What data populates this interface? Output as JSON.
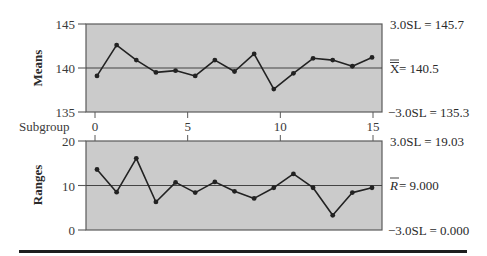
{
  "chart_data": [
    {
      "type": "line",
      "title": "X-bar chart",
      "ylabel": "Means",
      "xlabel": "Subgroup",
      "x": [
        1,
        2,
        3,
        4,
        5,
        6,
        7,
        8,
        9,
        10,
        11,
        12,
        13,
        14,
        15
      ],
      "series": [
        {
          "name": "Means",
          "values": [
            139.1,
            142.6,
            140.9,
            139.5,
            139.7,
            139.1,
            140.9,
            139.6,
            141.6,
            137.6,
            139.4,
            141.1,
            140.9,
            140.2,
            141.2
          ]
        }
      ],
      "ylim": [
        135,
        145
      ],
      "yticks": [
        "135",
        "140",
        "145"
      ],
      "xticks": [
        "0",
        "5",
        "10",
        "15"
      ],
      "center_line_value": 140,
      "control_limits": {
        "ucl": "3.0SL = 145.7",
        "center": "X = 140.5",
        "lcl": "−3.0SL = 135.3"
      },
      "grid": false
    },
    {
      "type": "line",
      "title": "R chart",
      "ylabel": "Ranges",
      "xlabel": "Subgroup",
      "x": [
        1,
        2,
        3,
        4,
        5,
        6,
        7,
        8,
        9,
        10,
        11,
        12,
        13,
        14,
        15
      ],
      "series": [
        {
          "name": "Ranges",
          "values": [
            13.6,
            8.5,
            16.1,
            6.3,
            10.7,
            8.4,
            10.8,
            8.7,
            7.1,
            9.5,
            12.6,
            9.5,
            3.3,
            8.4,
            9.5
          ]
        }
      ],
      "ylim": [
        0,
        20
      ],
      "yticks": [
        "0",
        "10",
        "20"
      ],
      "xticks": [
        "0",
        "5",
        "10",
        "15"
      ],
      "center_line_value": 10,
      "control_limits": {
        "ucl": "3.0SL = 19.03",
        "center": "R = 9.000",
        "lcl": "−3.0SL = 0.000"
      },
      "grid": false
    }
  ],
  "labels": {
    "means_axis": "Means",
    "ranges_axis": "Ranges",
    "subgroup": "Subgroup",
    "means_ucl": "3.0SL = 145.7",
    "means_center_symbol": "X",
    "means_center_value": " = 140.5",
    "means_lcl": "−3.0SL = 135.3",
    "ranges_ucl": "3.0SL = 19.03",
    "ranges_center_symbol": "R",
    "ranges_center_value": " = 9.000",
    "ranges_lcl": "−3.0SL = 0.000",
    "means_yticks": [
      "145",
      "140",
      "135"
    ],
    "ranges_yticks": [
      "20",
      "10",
      "0"
    ],
    "xticks": [
      "0",
      "5",
      "10",
      "15"
    ]
  },
  "colors": {
    "plot_bg": "#cbcbcb",
    "frame": "#5a5a5a",
    "line": "#222222",
    "center_line": "#444444"
  }
}
